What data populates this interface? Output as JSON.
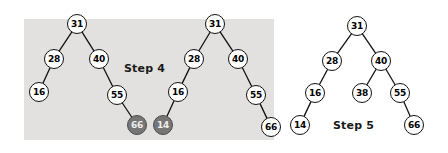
{
  "figure": {
    "background_color": "#ffffff",
    "highlight_color": "#e2e1df",
    "node_fill": "#ffffff",
    "node_stroke": "#111111",
    "marked_node_fill": "#767676",
    "marked_node_text": "#efefef"
  },
  "highlight_band": {
    "x": 24,
    "y": 19,
    "width": 250,
    "height": 121
  },
  "labels": [
    {
      "text": "Step 4",
      "x": 124,
      "y": 62
    },
    {
      "text": "Step 5",
      "x": 333,
      "y": 119
    }
  ],
  "trees": [
    {
      "name": "step4-before",
      "nodes": [
        {
          "id": "a31",
          "value": "31",
          "x": 77,
          "y": 24,
          "marked": false
        },
        {
          "id": "a28",
          "value": "28",
          "x": 54,
          "y": 59,
          "marked": false
        },
        {
          "id": "a40",
          "value": "40",
          "x": 99,
          "y": 59,
          "marked": false
        },
        {
          "id": "a16",
          "value": "16",
          "x": 39,
          "y": 92,
          "marked": false
        },
        {
          "id": "a55",
          "value": "55",
          "x": 117,
          "y": 95,
          "marked": false
        },
        {
          "id": "a66",
          "value": "66",
          "x": 137,
          "y": 125,
          "marked": true
        }
      ],
      "edges": [
        [
          "a31",
          "a28"
        ],
        [
          "a31",
          "a40"
        ],
        [
          "a28",
          "a16"
        ],
        [
          "a40",
          "a55"
        ],
        [
          "a55",
          "a66"
        ]
      ]
    },
    {
      "name": "step4-after",
      "nodes": [
        {
          "id": "b31",
          "value": "31",
          "x": 215,
          "y": 24,
          "marked": false
        },
        {
          "id": "b28",
          "value": "28",
          "x": 194,
          "y": 59,
          "marked": false
        },
        {
          "id": "b40",
          "value": "40",
          "x": 238,
          "y": 59,
          "marked": false
        },
        {
          "id": "b16",
          "value": "16",
          "x": 178,
          "y": 92,
          "marked": false
        },
        {
          "id": "b55",
          "value": "55",
          "x": 256,
          "y": 95,
          "marked": false
        },
        {
          "id": "b14",
          "value": "14",
          "x": 163,
          "y": 125,
          "marked": true
        },
        {
          "id": "b66",
          "value": "66",
          "x": 271,
          "y": 127,
          "marked": false
        }
      ],
      "edges": [
        [
          "b31",
          "b28"
        ],
        [
          "b31",
          "b40"
        ],
        [
          "b28",
          "b16"
        ],
        [
          "b40",
          "b55"
        ],
        [
          "b16",
          "b14"
        ],
        [
          "b55",
          "b66"
        ]
      ]
    },
    {
      "name": "step5",
      "nodes": [
        {
          "id": "c31",
          "value": "31",
          "x": 357,
          "y": 26,
          "marked": false
        },
        {
          "id": "c28",
          "value": "28",
          "x": 332,
          "y": 61,
          "marked": false
        },
        {
          "id": "c40",
          "value": "40",
          "x": 381,
          "y": 61,
          "marked": false
        },
        {
          "id": "c16",
          "value": "16",
          "x": 315,
          "y": 93,
          "marked": false
        },
        {
          "id": "c38",
          "value": "38",
          "x": 362,
          "y": 93,
          "marked": false
        },
        {
          "id": "c55",
          "value": "55",
          "x": 400,
          "y": 93,
          "marked": false
        },
        {
          "id": "c14",
          "value": "14",
          "x": 300,
          "y": 125,
          "marked": false
        },
        {
          "id": "c66",
          "value": "66",
          "x": 414,
          "y": 125,
          "marked": false
        }
      ],
      "edges": [
        [
          "c31",
          "c28"
        ],
        [
          "c31",
          "c40"
        ],
        [
          "c28",
          "c16"
        ],
        [
          "c40",
          "c38"
        ],
        [
          "c40",
          "c55"
        ],
        [
          "c16",
          "c14"
        ],
        [
          "c55",
          "c66"
        ]
      ]
    }
  ]
}
